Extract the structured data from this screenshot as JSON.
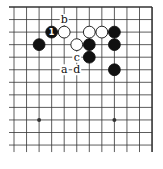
{
  "diagram": {
    "type": "go-board-fragment",
    "columns": 12,
    "rows": 12,
    "x0": 14,
    "y0": 7,
    "dx": 12.55,
    "dy": 12.55,
    "open_left": true,
    "open_bottom": true,
    "star_points": [
      [
        2,
        9
      ],
      [
        8,
        9
      ]
    ],
    "stones": [
      {
        "col": 3,
        "row": 2,
        "color": "black",
        "label": "1"
      },
      {
        "col": 4,
        "row": 2,
        "color": "white"
      },
      {
        "col": 6,
        "row": 2,
        "color": "white"
      },
      {
        "col": 7,
        "row": 2,
        "color": "white"
      },
      {
        "col": 8,
        "row": 2,
        "color": "black"
      },
      {
        "col": 2,
        "row": 3,
        "color": "black"
      },
      {
        "col": 5,
        "row": 3,
        "color": "white"
      },
      {
        "col": 6,
        "row": 3,
        "color": "black"
      },
      {
        "col": 8,
        "row": 3,
        "color": "black"
      },
      {
        "col": 6,
        "row": 4,
        "color": "black"
      },
      {
        "col": 8,
        "row": 5,
        "color": "black"
      }
    ],
    "labels": [
      {
        "col": 4,
        "row": 1,
        "text": "b"
      },
      {
        "col": 5,
        "row": 4,
        "text": "c"
      },
      {
        "col": 4,
        "row": 5,
        "text": "a"
      },
      {
        "col": 5,
        "row": 5,
        "text": "d"
      }
    ],
    "colors": {
      "line": "#333333",
      "black": "#111111",
      "white": "#ffffff",
      "bg": "#ffffff"
    }
  }
}
